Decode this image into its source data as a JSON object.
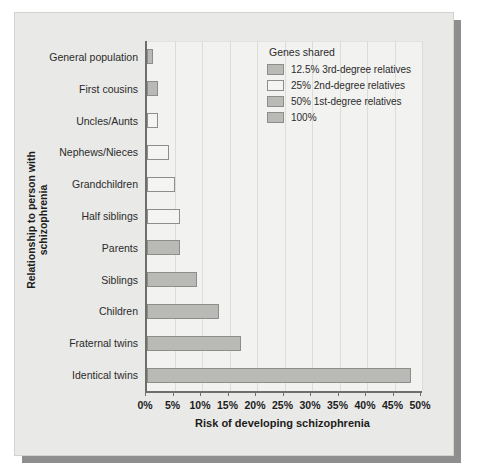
{
  "chart_data": {
    "type": "bar",
    "orientation": "horizontal",
    "title": "",
    "xlabel": "Risk of developing schizophrenia",
    "ylabel": "Relationship to person with schizophrenia",
    "xlim": [
      0,
      50
    ],
    "xunit": "%",
    "grid": true,
    "xticks": [
      0,
      5,
      10,
      15,
      20,
      25,
      30,
      35,
      40,
      45,
      50
    ],
    "xtick_labels": [
      "0%",
      "5%",
      "10%",
      "15%",
      "20%",
      "25%",
      "30%",
      "35%",
      "40%",
      "45%",
      "50%"
    ],
    "categories": [
      "General population",
      "First cousins",
      "Uncles/Aunts",
      "Nephews/Nieces",
      "Grandchildren",
      "Half siblings",
      "Parents",
      "Siblings",
      "Children",
      "Fraternal twins",
      "Identical twins"
    ],
    "values": [
      1,
      2,
      2,
      4,
      5,
      6,
      6,
      9,
      13,
      17,
      48
    ],
    "point_groups": [
      "g125",
      "g125",
      "g25",
      "g25",
      "g25",
      "g25",
      "g50",
      "g50",
      "g50",
      "g50",
      "g100"
    ],
    "legend": {
      "position": "top-right",
      "title": "Genes shared",
      "entries": [
        {
          "key": "g125",
          "label": "12.5% 3rd-degree relatives",
          "color": "#b9b9b6"
        },
        {
          "key": "g25",
          "label": "25% 2nd-degree relatives",
          "color": "#f4f4f2"
        },
        {
          "key": "g50",
          "label": "50% 1st-degree relatives",
          "color": "#b9b9b6"
        },
        {
          "key": "g100",
          "label": "100%",
          "color": "#b9b9b6"
        }
      ]
    },
    "colors": {
      "plot_background": "#f2f2f0",
      "panel_background": "#e9e9e7",
      "bar_outline": "#8d8d8d",
      "gridline": "#dcdcd8",
      "axis": "#6e6e6e",
      "text": "#1c1c1c"
    }
  }
}
